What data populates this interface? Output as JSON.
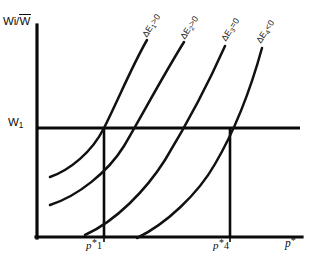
{
  "figure": {
    "type": "economics-isoquant-diagram",
    "background_color": "#ffffff",
    "line_color": "#0d0d0d"
  },
  "axes": {
    "y_axis_label": "Wi/",
    "y_axis_label_bar": "W",
    "x_axis_label_symbol": "p",
    "x_axis_label_sup": "*",
    "origin_x_px": 36,
    "origin_y_px": 238,
    "y_top_px": 25,
    "x_right_px": 302
  },
  "level_line": {
    "label": "W",
    "label_sub": "1",
    "y_px": 128,
    "x_start_px": 36,
    "x_end_px": 300
  },
  "x_ticks": [
    {
      "name": "p-star-1",
      "symbol": "p",
      "sup": "*",
      "num": "1",
      "x_px": 104
    },
    {
      "name": "p-star-4",
      "symbol": "p",
      "sup": "*",
      "num": "4",
      "x_px": 230
    }
  ],
  "curves": [
    {
      "id": "curve-1",
      "label_prefix": "ΔE",
      "label_sub": "1",
      "label_suffix": ">0",
      "path": "M 50 177 C 70 170 92 152 104 128 C 118 100 133 64 147 40",
      "crosses_level_at_x_px": 104,
      "has_drop_line": true
    },
    {
      "id": "curve-2",
      "label_prefix": "ΔE",
      "label_sub": "2",
      "label_suffix": ">0",
      "path": "M 50 205 C 78 196 108 172 124 146 C 141 117 164 74 184 42",
      "crosses_level_at_x_px": 134,
      "has_drop_line": false
    },
    {
      "id": "curve-3",
      "label_prefix": "ΔE",
      "label_sub": "3",
      "label_suffix": "=0",
      "path": "M 85 235 C 116 221 146 190 165 160 C 185 127 209 82 225 46",
      "crosses_level_at_x_px": 178,
      "has_drop_line": false
    },
    {
      "id": "curve-4",
      "label_prefix": "ΔE",
      "label_sub": "4",
      "label_suffix": "<0",
      "path": "M 137 238 C 166 224 198 194 215 164 C 235 130 251 88 262 48",
      "crosses_level_at_x_px": 230,
      "has_drop_line": true
    }
  ],
  "drop_lines": [
    {
      "name": "drop-line-p1",
      "x_px": 104,
      "y_top_px": 128,
      "y_bottom_px": 238
    },
    {
      "name": "drop-line-p4",
      "x_px": 230,
      "y_top_px": 128,
      "y_bottom_px": 238
    }
  ]
}
